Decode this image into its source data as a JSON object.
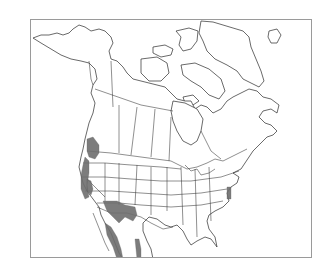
{
  "map": {
    "title": "",
    "region": "North America",
    "style": "black-and-white outline map with state and province borders",
    "frame": {
      "x": 30,
      "y": 19,
      "width": 282,
      "height": 239,
      "color": "#9a9a9a"
    },
    "colors": {
      "land_fill": "#ffffff",
      "outline": "#2a2a2a",
      "range_fill": "#6e6e6e"
    },
    "range_areas": [
      {
        "name": "pacific-northwest-coast",
        "description": "Washington coast / Puget Sound"
      },
      {
        "name": "oregon-california-coast",
        "description": "Pacific coastal strip"
      },
      {
        "name": "central-valley-sierra",
        "description": "California interior"
      },
      {
        "name": "arizona-new-mexico",
        "description": "Southwest highlands"
      },
      {
        "name": "sierra-madre-occidental",
        "description": "Western Mexico mountains"
      },
      {
        "name": "sierra-madre-oriental",
        "description": "Eastern Mexico mountains"
      },
      {
        "name": "chesapeake",
        "description": "Mid-Atlantic coast"
      }
    ]
  }
}
